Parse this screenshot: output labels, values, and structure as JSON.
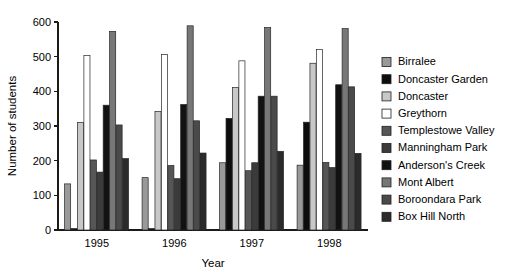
{
  "chart_data": {
    "type": "bar",
    "title": "",
    "subtitle": "",
    "xlabel": "Year",
    "ylabel": "Number of students",
    "categories": [
      "1995",
      "1996",
      "1997",
      "1998"
    ],
    "ylim": [
      0,
      600
    ],
    "y_ticks": [
      0,
      100,
      200,
      300,
      400,
      500,
      600
    ],
    "y_tick_labels": [
      "0",
      "100",
      "200",
      "300",
      "400",
      "500",
      "600"
    ],
    "grid": false,
    "legend_position": "right",
    "series": [
      {
        "name": "Birralee",
        "color": "#999999",
        "pattern": "solid",
        "values": [
          133,
          151,
          194,
          187
        ]
      },
      {
        "name": "Doncaster Garden",
        "color": "#0d0d0d",
        "pattern": "solid",
        "values": [
          4,
          4,
          322,
          311
        ]
      },
      {
        "name": "Doncaster",
        "color": "#c8c8c8",
        "pattern": "solid",
        "values": [
          310,
          342,
          411,
          481
        ]
      },
      {
        "name": "Greythorn",
        "color": "#ffffff",
        "pattern": "solid",
        "values": [
          503,
          506,
          488,
          521
        ]
      },
      {
        "name": "Templestowe Valley",
        "color": "#565656",
        "pattern": "solid",
        "values": [
          202,
          186,
          171,
          195
        ]
      },
      {
        "name": "Manningham Park",
        "color": "#3b3b3b",
        "pattern": "solid",
        "values": [
          167,
          148,
          194,
          180
        ]
      },
      {
        "name": "Anderson's Creek",
        "color": "#121212",
        "pattern": "solid",
        "values": [
          360,
          362,
          386,
          419
        ]
      },
      {
        "name": "Mont Albert",
        "color": "#777777",
        "pattern": "solid",
        "values": [
          573,
          589,
          584,
          581
        ]
      },
      {
        "name": "Boroondara Park",
        "color": "#4a4a4a",
        "pattern": "solid",
        "values": [
          303,
          315,
          386,
          413
        ]
      },
      {
        "name": "Box Hill North",
        "color": "#2b2b2b",
        "pattern": "solid",
        "values": [
          206,
          222,
          227,
          221
        ]
      }
    ]
  },
  "legend": {
    "items": [
      "Birralee",
      "Doncaster Garden",
      "Doncaster",
      "Greythorn",
      "Templestowe Valley",
      "Manningham Park",
      "Anderson's Creek",
      "Mont Albert",
      "Boroondara Park",
      "Box Hill North"
    ]
  }
}
